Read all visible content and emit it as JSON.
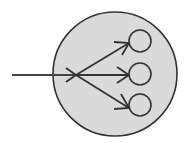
{
  "diagram": {
    "type": "fan-out",
    "colors": {
      "background": "#ffffff",
      "container_fill": "#dadada",
      "stroke": "#333333",
      "node_fill": "#dadada"
    },
    "container": {
      "cx": 115,
      "cy": 74,
      "r": 62
    },
    "input_line": {
      "x1": 12,
      "y1": 75,
      "x2": 76,
      "y2": 75
    },
    "origin": {
      "x": 76,
      "y": 75
    },
    "targets": [
      {
        "id": "target-top",
        "cx": 140,
        "cy": 41,
        "r": 11,
        "tip": [
          129,
          43
        ]
      },
      {
        "id": "target-middle",
        "cx": 140,
        "cy": 74,
        "r": 11,
        "tip": [
          129,
          75
        ]
      },
      {
        "id": "target-bottom",
        "cx": 140,
        "cy": 105,
        "r": 11,
        "tip": [
          129,
          108
        ]
      }
    ]
  }
}
